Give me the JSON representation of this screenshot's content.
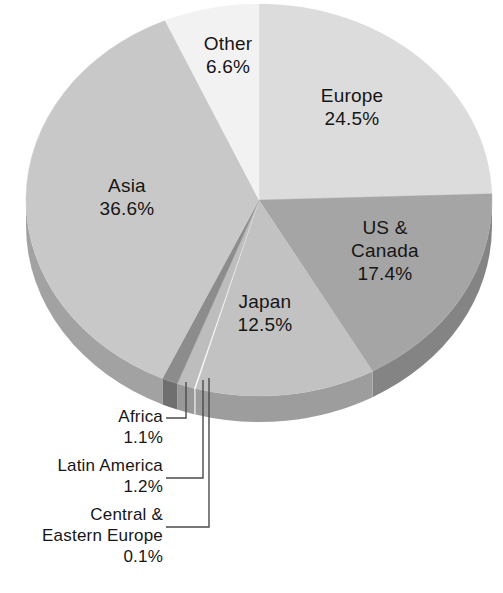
{
  "chart_data": {
    "type": "pie",
    "title": "",
    "subtitle": "",
    "xlabel": "",
    "ylabel": "",
    "legend_position": "none",
    "grid": false,
    "style": "3d-pie-grayscale",
    "units": "percent",
    "total": 100.0,
    "categories": [
      "Europe",
      "US & Canada",
      "Japan",
      "Central & Eastern Europe",
      "Latin America",
      "Africa",
      "Asia",
      "Other"
    ],
    "values": [
      24.5,
      17.4,
      12.5,
      0.1,
      1.2,
      1.1,
      36.6,
      6.6
    ],
    "slices": [
      {
        "name": "Europe",
        "value": 24.5,
        "value_text": "24.5%",
        "color": "#dcdcdc",
        "side_color": "#b3b3b3",
        "label_placement": "inside",
        "label_x": 352,
        "label_y": 92
      },
      {
        "name": "US & Canada",
        "value": 17.4,
        "value_text": "17.4%",
        "color": "#a5a5a5",
        "side_color": "#848484",
        "label_placement": "inside",
        "label_x": 385,
        "label_y": 236,
        "name_line_1": "US &",
        "name_line_2": "Canada"
      },
      {
        "name": "Japan",
        "value": 12.5,
        "value_text": "12.5%",
        "color": "#c2c2c2",
        "side_color": "#9d9d9d",
        "label_placement": "inside",
        "label_x": 265,
        "label_y": 300
      },
      {
        "name": "Central & Eastern Europe",
        "value": 0.1,
        "value_text": "0.1%",
        "color": "#fdfdfd",
        "side_color": "#d6d6d6",
        "label_placement": "callout",
        "name_line_1": "Central &",
        "name_line_2": "Eastern Europe"
      },
      {
        "name": "Latin America",
        "value": 1.2,
        "value_text": "1.2%",
        "color": "#bdbdbd",
        "side_color": "#989898",
        "label_placement": "callout"
      },
      {
        "name": "Africa",
        "value": 1.1,
        "value_text": "1.1%",
        "color": "#8c8c8c",
        "side_color": "#6f6f6f",
        "label_placement": "callout"
      },
      {
        "name": "Asia",
        "value": 36.6,
        "value_text": "36.6%",
        "color": "#c8c8c8",
        "side_color": "#a2a2a2",
        "label_placement": "inside",
        "label_x": 127,
        "label_y": 184
      },
      {
        "name": "Other",
        "value": 6.6,
        "value_text": "6.6%",
        "color": "#f2f2f2",
        "side_color": "#cccccc",
        "label_placement": "inside",
        "label_x": 228,
        "label_y": 40
      }
    ],
    "callouts": [
      {
        "name": "Africa",
        "value_text": "1.1%",
        "text_right": 163,
        "text_top": 410
      },
      {
        "name": "Latin America",
        "value_text": "1.2%",
        "text_right": 163,
        "text_top": 459
      },
      {
        "name": "Central & Eastern Europe",
        "value_text": "0.1%",
        "text_right": 163,
        "text_top": 508
      }
    ]
  },
  "colors": {
    "background": "#ffffff",
    "text": "#161616",
    "leader_line": "#4a4a4a"
  }
}
